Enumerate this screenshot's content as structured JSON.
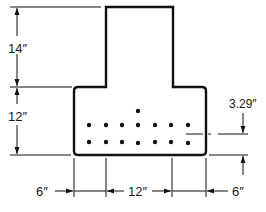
{
  "diagram": {
    "type": "inverted T-beam cross-section with reinforcement",
    "colors": {
      "stroke": "#111111",
      "background": "#ffffff"
    },
    "dimensions": {
      "stem_height": "14″",
      "flange_height": "12″",
      "left_overhang": "6″",
      "stem_width": "12″",
      "right_overhang": "6″",
      "centroid_offset": "3.29″"
    },
    "reinforcement": {
      "rows": [
        {
          "name": "top-single",
          "count": 1
        },
        {
          "name": "middle-row",
          "count": 7
        },
        {
          "name": "bottom-row",
          "count": 7
        }
      ],
      "total_bars": 15
    }
  }
}
